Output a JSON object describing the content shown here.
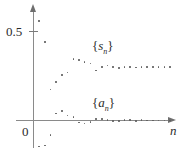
{
  "figure": {
    "background": "#ffffff",
    "point_color": "#5d5d5d",
    "axis_color": "#8a8a8a"
  },
  "axes": {
    "y_tick_label": "0.5",
    "origin_label": "0",
    "x_axis_label": "n",
    "x_axis_arrow": "arrow-right-icon",
    "y_axis_arrow": "arrow-up-icon"
  },
  "series_labels": {
    "upper": "{sₙ}",
    "lower": "{aₙ}",
    "upper_base": "s",
    "upper_sub": "n",
    "lower_base": "a",
    "lower_sub": "n",
    "brace_open": "{",
    "brace_close": "}"
  },
  "chart_data": {
    "type": "scatter",
    "title": "",
    "xlabel": "n",
    "ylabel": "",
    "xlim": [
      0,
      24
    ],
    "ylim": [
      -0.22,
      0.62
    ],
    "grid": false,
    "legend": "inline-annotations",
    "yticks": [
      0.5
    ],
    "ytick_labels": [
      "0.5"
    ],
    "annotations": [
      {
        "text": "{sₙ}",
        "x": 11.5,
        "y": 0.4
      },
      {
        "text": "{aₙ}",
        "x": 11.5,
        "y": 0.115
      }
    ],
    "series": [
      {
        "name": "{sₙ}",
        "description": "partial sums converging to about 0.30",
        "x": [
          1,
          2,
          3,
          4,
          5,
          6,
          7,
          8,
          9,
          10,
          11,
          12,
          13,
          14,
          15,
          16,
          17,
          18,
          19,
          20,
          21,
          22,
          23,
          24
        ],
        "values": [
          0.56,
          0.44,
          0.175,
          0.215,
          0.255,
          0.27,
          0.345,
          0.34,
          0.33,
          0.32,
          0.28,
          0.3,
          0.31,
          0.3,
          0.296,
          0.302,
          0.3,
          0.298,
          0.302,
          0.3,
          0.299,
          0.301,
          0.3,
          0.3
        ]
      },
      {
        "name": "{aₙ}",
        "description": "alternating terms damping to 0",
        "x": [
          1,
          2,
          3,
          4,
          5,
          6,
          7,
          8,
          9,
          10,
          11,
          12,
          13,
          14,
          15,
          16,
          17,
          18,
          19,
          20,
          21,
          22,
          23,
          24
        ],
        "values": [
          -0.145,
          -0.14,
          -0.08,
          0.04,
          0.055,
          0.028,
          0.018,
          -0.012,
          -0.016,
          -0.01,
          0.008,
          0.007,
          0.004,
          -0.004,
          -0.003,
          0.003,
          0.002,
          -0.002,
          0.002,
          0.001,
          -0.001,
          0.001,
          0.0,
          0.0
        ]
      }
    ]
  }
}
